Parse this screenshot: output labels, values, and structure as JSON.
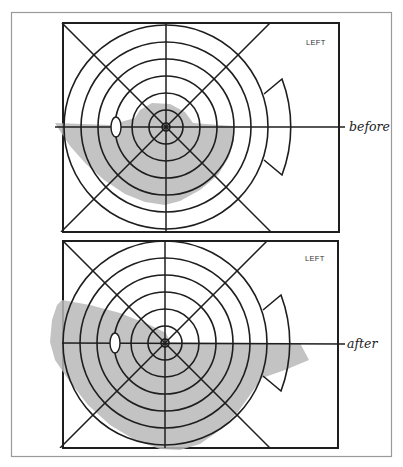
{
  "figure": {
    "panels": [
      {
        "id": "before",
        "eye_label": "LEFT",
        "state_label": "before",
        "center": [
          166,
          127
        ],
        "rect": [
          63,
          23,
          339,
          232
        ],
        "ring_radii": [
          4,
          17,
          34,
          51,
          68,
          85,
          102
        ],
        "temporal_arc_radius": 136,
        "blind_spot": {
          "cx": 116,
          "cy": 127,
          "rx": 5,
          "ry": 10
        },
        "defect_region": "inferior field loss with small superior-central extension"
      },
      {
        "id": "after",
        "eye_label": "LEFT",
        "state_label": "after",
        "center": [
          165,
          343
        ],
        "rect": [
          63,
          241,
          338,
          448
        ],
        "ring_radii": [
          4,
          17,
          34,
          51,
          68,
          85,
          102
        ],
        "temporal_arc_radius": 136,
        "blind_spot": {
          "cx": 115,
          "cy": 343,
          "rx": 5,
          "ry": 10
        },
        "defect_region": "enlarged inferior and superonasal field loss extending temporally"
      }
    ],
    "colors": {
      "frame": "#9a9a9a",
      "lines": "#1e1e1e",
      "shading": "#b9b9b9"
    }
  }
}
